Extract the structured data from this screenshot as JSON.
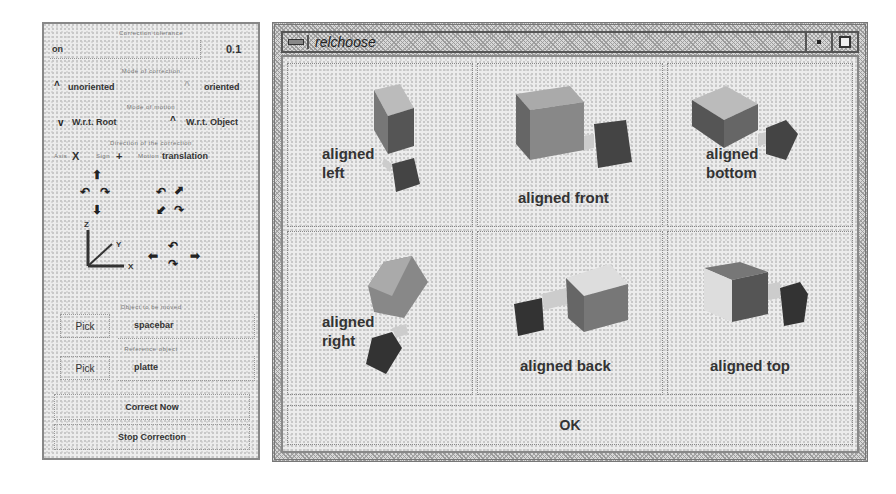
{
  "panel": {
    "tolerance": {
      "label": "Correction tolerance",
      "name": "on",
      "value": "0.1"
    },
    "mode": {
      "label": "Mode of correction",
      "options": [
        "unoriented",
        "oriented"
      ],
      "selected": "oriented"
    },
    "frame": {
      "label": "Mode of motion",
      "options": [
        "W.r.t. Root",
        "W.r.t. Object"
      ],
      "selected": "W.r.t. Object"
    },
    "direction": {
      "label": "Direction of the correction",
      "axis_label": "Axis",
      "axis_value": "X",
      "sign_label": "Sign",
      "sign_value": "+",
      "motion_label": "Motion",
      "motion_value": "translation"
    },
    "axes": {
      "z": "Z",
      "y": "Y",
      "x": "X"
    },
    "object": {
      "label": "Object to be moved",
      "pick": "Pick",
      "value": "spacebar"
    },
    "reference": {
      "label": "Reference object",
      "pick": "Pick",
      "value": "platte"
    },
    "correct_now": "Correct Now",
    "stop_correction": "Stop Correction",
    "icons": {
      "up": "⬆",
      "down": "⬇",
      "rot_ccw": "↶",
      "rot_cw": "↷",
      "diag_ne": "⬈",
      "diag_sw": "⬋",
      "left": "⬅",
      "right": "➡"
    }
  },
  "window": {
    "title": "relchoose",
    "options": [
      {
        "line1": "aligned",
        "line2": "left"
      },
      {
        "line1": "aligned front",
        "line2": ""
      },
      {
        "line1": "aligned",
        "line2": "bottom"
      },
      {
        "line1": "aligned",
        "line2": "right"
      },
      {
        "line1": "aligned back",
        "line2": ""
      },
      {
        "line1": "aligned top",
        "line2": ""
      }
    ],
    "ok": "OK"
  }
}
